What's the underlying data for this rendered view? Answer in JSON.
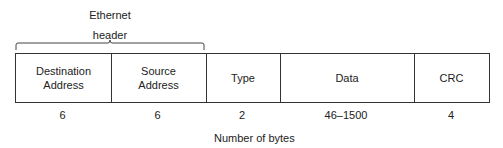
{
  "header_group": {
    "line1": "Ethernet",
    "line2": "header"
  },
  "fields": [
    {
      "name_line1": "Destination",
      "name_line2": "Address",
      "bytes": "6"
    },
    {
      "name_line1": "Source",
      "name_line2": "Address",
      "bytes": "6"
    },
    {
      "name_line1": "Type",
      "name_line2": "",
      "bytes": "2"
    },
    {
      "name_line1": "Data",
      "name_line2": "",
      "bytes": "46–1500"
    },
    {
      "name_line1": "CRC",
      "name_line2": "",
      "bytes": "4"
    }
  ],
  "caption": "Number of bytes"
}
